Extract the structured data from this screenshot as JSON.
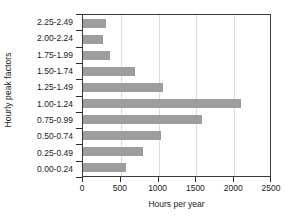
{
  "chart_data": {
    "type": "bar",
    "orientation": "horizontal",
    "title": "",
    "xlabel": "Hours per year",
    "ylabel": "Hourly peak factors",
    "categories": [
      "2.25-2.49",
      "2.00-2.24",
      "1.75-1.99",
      "1.50-1.74",
      "1.25-1.49",
      "1.00-1.24",
      "0.75-0.99",
      "0.50-0.74",
      "0.25-0.49",
      "0.00-0.24"
    ],
    "values": [
      300,
      270,
      355,
      685,
      1055,
      2090,
      1580,
      1030,
      790,
      565
    ],
    "xlim": [
      0,
      2500
    ],
    "xticks": [
      0,
      500,
      1000,
      1500,
      2000,
      2500
    ],
    "xtick_labels": [
      "0",
      "500",
      "1000",
      "1500",
      "2000",
      "2500"
    ],
    "grid": true,
    "grid_axis": "x",
    "legend": "none",
    "bar_color": "#9d9d9d",
    "axis_color": "#3a3a3a",
    "grid_color": "#dcdcdc"
  }
}
